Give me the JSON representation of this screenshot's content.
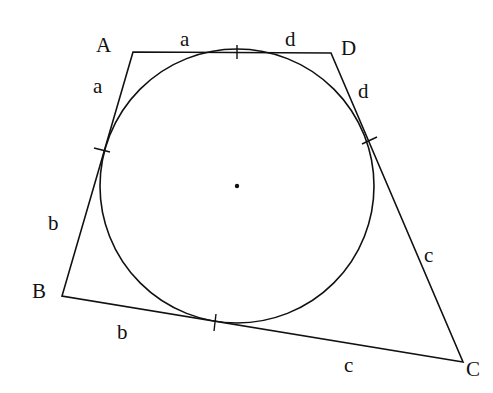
{
  "diagram": {
    "vertices": [
      {
        "id": "A",
        "label": "A"
      },
      {
        "id": "B",
        "label": "B"
      },
      {
        "id": "C",
        "label": "C"
      },
      {
        "id": "D",
        "label": "D"
      }
    ],
    "tangent_lengths": [
      {
        "side": "AD",
        "near": "A",
        "label": "a"
      },
      {
        "side": "AD",
        "near": "D",
        "label": "d"
      },
      {
        "side": "AB",
        "near": "A",
        "label": "a"
      },
      {
        "side": "AB",
        "near": "B",
        "label": "b"
      },
      {
        "side": "DC",
        "near": "D",
        "label": "d"
      },
      {
        "side": "DC",
        "near": "C",
        "label": "c"
      },
      {
        "side": "BC",
        "near": "B",
        "label": "b"
      },
      {
        "side": "BC",
        "near": "C",
        "label": "c"
      }
    ],
    "incircle": {
      "center_marked": true,
      "tangent_points_marked": 4
    },
    "colors": {
      "ink": "#111111",
      "background": "#ffffff"
    }
  }
}
